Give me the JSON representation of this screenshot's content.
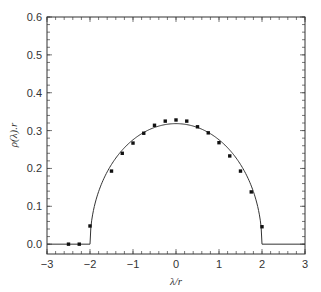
{
  "chart_data": {
    "type": "line",
    "title": "",
    "xlabel": "λ/r",
    "ylabel": "ρ(λ).r",
    "xlim": [
      -3,
      3
    ],
    "ylim": [
      -0.026,
      0.6
    ],
    "x_ticks": [
      -3,
      -2,
      -1,
      0,
      1,
      2,
      3
    ],
    "x_tick_labels": [
      "−3",
      "−2",
      "−1",
      "0",
      "1",
      "2",
      "3"
    ],
    "y_ticks": [
      0.0,
      0.1,
      0.2,
      0.3,
      0.4,
      0.5,
      0.6
    ],
    "y_tick_labels": [
      "0.0",
      "0.1",
      "0.2",
      "0.3",
      "0.4",
      "0.5",
      "0.6"
    ],
    "x_minor_step": 0.2,
    "y_minor_step": 0.02,
    "grid": false,
    "legend": null,
    "series": [
      {
        "name": "semicircle law",
        "kind": "line",
        "formula": "sqrt(4 - x^2) / (2*pi) for |x|<=2, else 0",
        "color": "#333333"
      },
      {
        "name": "numerical data",
        "kind": "scatter",
        "color": "#111111",
        "x": [
          -2.5,
          -2.25,
          -2.0,
          -1.5,
          -1.25,
          -1.0,
          -0.75,
          -0.5,
          -0.25,
          0.0,
          0.25,
          0.5,
          0.75,
          1.0,
          1.25,
          1.5,
          1.75,
          2.0
        ],
        "y": [
          0.0,
          0.0,
          0.048,
          0.193,
          0.24,
          0.267,
          0.293,
          0.314,
          0.325,
          0.328,
          0.325,
          0.31,
          0.294,
          0.268,
          0.233,
          0.193,
          0.138,
          0.046
        ]
      }
    ]
  },
  "plot_frame": {
    "left": 47,
    "right": 305,
    "top": 17,
    "bottom": 254
  }
}
